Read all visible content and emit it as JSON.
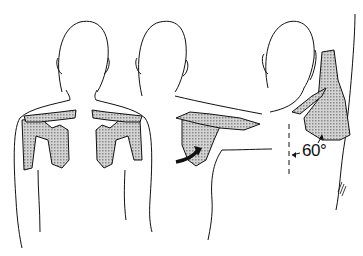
{
  "figure": {
    "panels": [
      {
        "id": "left",
        "label": "arms at rest, both scapulae shaded"
      },
      {
        "id": "middle",
        "label": "arm abducted, arrow indicating scapular rotation"
      },
      {
        "id": "right",
        "label": "lateral view with scapular angle"
      }
    ],
    "annotations": {
      "angle": "60°"
    },
    "colors": {
      "line": "#111111",
      "shading": "#b8b8b8",
      "background": "#ffffff"
    }
  }
}
